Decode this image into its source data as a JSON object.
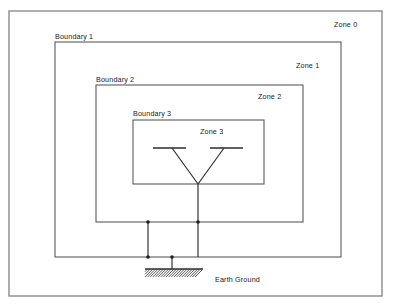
{
  "diagram": {
    "frame": {
      "x": 9,
      "y": 11,
      "width": 373,
      "height": 285
    },
    "colors": {
      "background": "#ffffff",
      "frame_stroke": "#8a8a8a",
      "zone_stroke": "#4a4a4a",
      "conductor_stroke": "#2b2b2b",
      "text": "#1a1a1a"
    },
    "zones": [
      {
        "id": "zone-0",
        "zone_label": "Zone 0",
        "boundary_label": null,
        "zone_label_pos": {
          "x": 334,
          "y": 27
        },
        "rect": null
      },
      {
        "id": "zone-1",
        "zone_label": "Zone 1",
        "boundary_label": "Boundary 1",
        "zone_label_pos": {
          "x": 296,
          "y": 68
        },
        "boundary_label_pos": {
          "x": 55,
          "y": 39
        },
        "rect": {
          "x": 55,
          "y": 42,
          "width": 286,
          "height": 215
        }
      },
      {
        "id": "zone-2",
        "zone_label": "Zone 2",
        "boundary_label": "Boundary 2",
        "zone_label_pos": {
          "x": 258,
          "y": 99
        },
        "boundary_label_pos": {
          "x": 96,
          "y": 82
        },
        "rect": {
          "x": 96,
          "y": 85,
          "width": 207,
          "height": 137
        }
      },
      {
        "id": "zone-3",
        "zone_label": "Zone 3",
        "boundary_label": "Boundary 3",
        "zone_label_pos": {
          "x": 200,
          "y": 134
        },
        "boundary_label_pos": {
          "x": 133,
          "y": 116
        },
        "rect": {
          "x": 133,
          "y": 120,
          "width": 131,
          "height": 64
        }
      }
    ],
    "ground": {
      "label": "Earth Ground",
      "label_pos": {
        "x": 215,
        "y": 282
      },
      "symbol_bar": {
        "x1": 145,
        "y1": 269,
        "x2": 203,
        "y2": 269
      },
      "hatch_count": 22,
      "hatch_depth": 8
    },
    "antenna": {
      "apex": {
        "x": 198,
        "y": 184
      },
      "left_arm_end": {
        "x": 172,
        "y": 148
      },
      "right_arm_end": {
        "x": 224,
        "y": 148
      },
      "left_bar": {
        "x1": 153,
        "y1": 148,
        "x2": 186,
        "y2": 148
      },
      "right_bar": {
        "x1": 210,
        "y1": 148,
        "x2": 243,
        "y2": 148
      }
    },
    "conductors": [
      {
        "id": "apex-to-boundary1",
        "x1": 198,
        "y1": 184,
        "x2": 198,
        "y2": 257
      },
      {
        "id": "boundary2-left-drop",
        "x1": 148,
        "y1": 222,
        "x2": 148,
        "y2": 257
      },
      {
        "id": "ground-riser",
        "x1": 172,
        "y1": 257,
        "x2": 172,
        "y2": 269
      }
    ],
    "junctions": [
      {
        "id": "junction-boundary2-center",
        "x": 198,
        "y": 222
      },
      {
        "id": "junction-boundary2-left",
        "x": 148,
        "y": 222
      },
      {
        "id": "junction-boundary1-left",
        "x": 148,
        "y": 257
      },
      {
        "id": "junction-boundary1-ground",
        "x": 172,
        "y": 257
      }
    ]
  }
}
